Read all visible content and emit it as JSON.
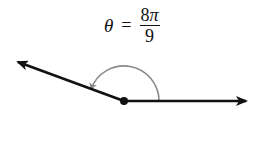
{
  "label": {
    "variable": "θ",
    "equals": "=",
    "numerator": "8π",
    "numerator_coeff": "8",
    "numerator_symbol": "π",
    "denominator": "9"
  },
  "diagram": {
    "angle_radians": "8π/9",
    "angle_degrees": 160,
    "ray_color": "#111111",
    "arc_color": "#8a8a8a"
  }
}
